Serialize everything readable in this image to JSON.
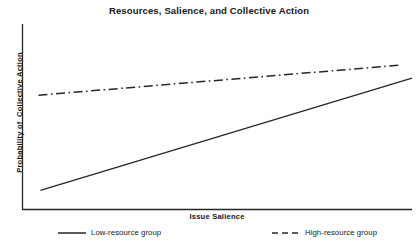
{
  "chart_data": {
    "type": "line",
    "title": "Resources, Salience, and Collective Action",
    "xlabel": "Issue Salience",
    "ylabel": "Probability of  Collective Action",
    "grid": false,
    "legend_position": "bottom",
    "xlim": [
      0,
      1
    ],
    "ylim": [
      0,
      1
    ],
    "x_tick_labels": [],
    "y_tick_labels": [],
    "axis_color": "#262626",
    "series": [
      {
        "name": "Low-resource group",
        "style": "solid",
        "color": "#262626",
        "x": [
          0.046,
          1.0
        ],
        "values": [
          0.103,
          0.708
        ]
      },
      {
        "name": "High-resource group",
        "style": "dash-dot",
        "color": "#262626",
        "x": [
          0.041,
          0.969
        ],
        "values": [
          0.616,
          0.778
        ]
      }
    ]
  },
  "legend": {
    "items": [
      {
        "label": "Low-resource group",
        "style": "solid"
      },
      {
        "label": "High-resource group",
        "style": "dashed"
      }
    ]
  }
}
